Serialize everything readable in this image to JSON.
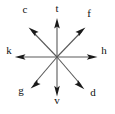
{
  "figure": {
    "background_color": "#ffffff",
    "line_color": "#5a5a5a",
    "arrowhead_color": "#1a1a1a",
    "label_color": "#111111",
    "origin": {
      "x": 57,
      "y": 57
    },
    "rays": [
      {
        "id": "ray-north",
        "label": "t",
        "direction": "north",
        "angle_deg": 90,
        "tip": {
          "x": 57,
          "y": 18
        },
        "label_pos": {
          "x": 57,
          "y": 4
        }
      },
      {
        "id": "ray-northeast",
        "label": "f",
        "direction": "northeast",
        "angle_deg": 45,
        "tip": {
          "x": 85,
          "y": 28
        },
        "label_pos": {
          "x": 89,
          "y": 14
        }
      },
      {
        "id": "ray-east",
        "label": "h",
        "direction": "east",
        "angle_deg": 0,
        "tip": {
          "x": 97,
          "y": 57
        },
        "label_pos": {
          "x": 104,
          "y": 51
        }
      },
      {
        "id": "ray-southeast",
        "label": "d",
        "direction": "southeast",
        "angle_deg": -45,
        "tip": {
          "x": 84,
          "y": 89
        },
        "label_pos": {
          "x": 93,
          "y": 92
        }
      },
      {
        "id": "ray-south",
        "label": "v",
        "direction": "south",
        "angle_deg": -90,
        "tip": {
          "x": 57,
          "y": 96
        },
        "label_pos": {
          "x": 57,
          "y": 99
        }
      },
      {
        "id": "ray-southwest",
        "label": "g",
        "direction": "southwest",
        "angle_deg": -135,
        "tip": {
          "x": 31,
          "y": 88
        },
        "label_pos": {
          "x": 21,
          "y": 89
        }
      },
      {
        "id": "ray-west",
        "label": "k",
        "direction": "west",
        "angle_deg": 180,
        "tip": {
          "x": 15,
          "y": 57
        },
        "label_pos": {
          "x": 9,
          "y": 50
        }
      },
      {
        "id": "ray-northwest",
        "label": "c",
        "direction": "northwest",
        "angle_deg": 135,
        "tip": {
          "x": 29,
          "y": 28
        },
        "label_pos": {
          "x": 25,
          "y": 9
        }
      }
    ]
  }
}
